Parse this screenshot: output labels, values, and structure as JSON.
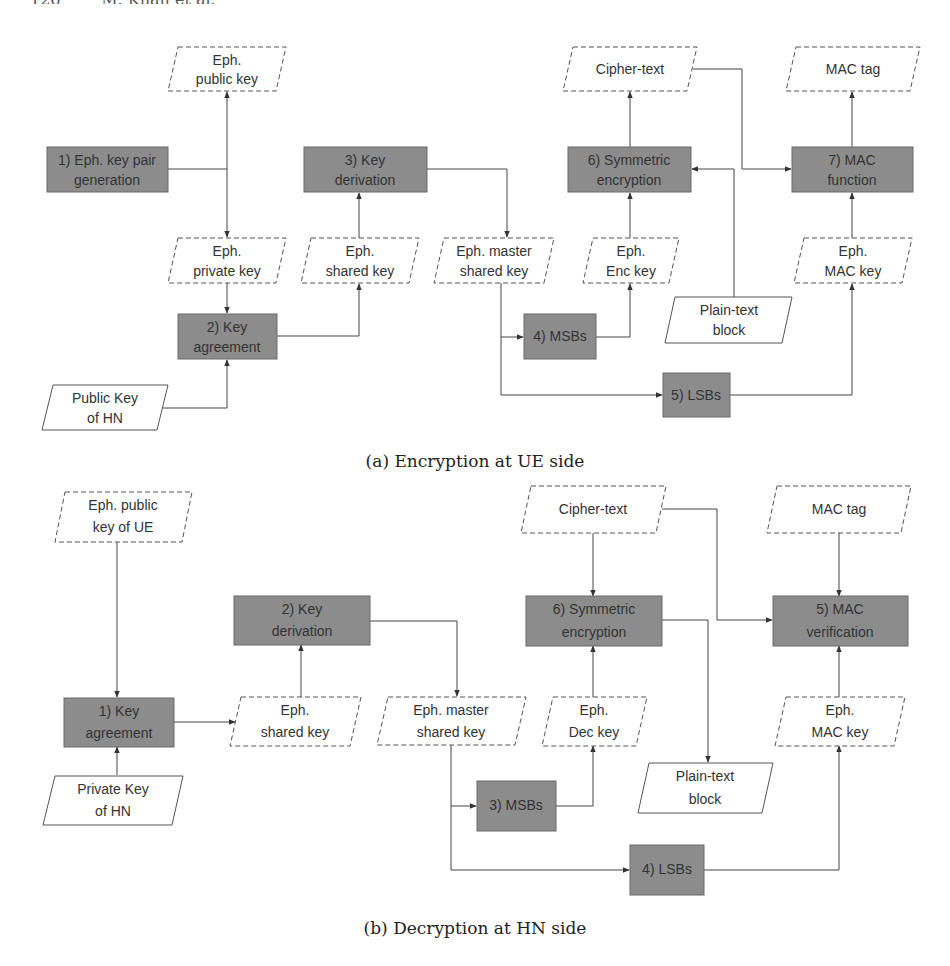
{
  "page_header": "126        M. Khan et al.",
  "colors": {
    "process_fill": "#8c8c8c",
    "process_stroke": "#6a6a6a",
    "data_stroke": "#555555",
    "edge": "#444444",
    "background": "#ffffff"
  },
  "figure_a": {
    "caption": "(a) Encryption at UE side",
    "nodes": {
      "eph_public_key": [
        "Eph.",
        "public key"
      ],
      "keypair_gen": [
        "1) Eph. key pair",
        "generation"
      ],
      "eph_private_key": [
        "Eph.",
        "private key"
      ],
      "key_agreement": [
        "2) Key",
        "agreement"
      ],
      "public_key_hn": [
        "Public Key",
        "of HN"
      ],
      "key_derivation": [
        "3) Key",
        "derivation"
      ],
      "eph_shared_key": [
        "Eph.",
        "shared key"
      ],
      "eph_master_shared_key": [
        "Eph. master",
        "shared key"
      ],
      "msbs": [
        "4) MSBs"
      ],
      "eph_enc_key": [
        "Eph.",
        "Enc key"
      ],
      "sym_encryption": [
        "6) Symmetric",
        "encryption"
      ],
      "cipher_text": [
        "Cipher-text"
      ],
      "plain_text_block": [
        "Plain-text",
        "block"
      ],
      "lsbs": [
        "5) LSBs"
      ],
      "eph_mac_key": [
        "Eph.",
        "MAC key"
      ],
      "mac_function": [
        "7) MAC",
        "function"
      ],
      "mac_tag": [
        "MAC tag"
      ]
    }
  },
  "figure_b": {
    "caption": "(b) Decryption at HN side",
    "nodes": {
      "eph_public_key_ue": [
        "Eph. public",
        "key of UE"
      ],
      "key_agreement": [
        "1) Key",
        "agreement"
      ],
      "private_key_hn": [
        "Private Key",
        "of HN"
      ],
      "key_derivation": [
        "2) Key",
        "derivation"
      ],
      "eph_shared_key": [
        "Eph.",
        "shared key"
      ],
      "eph_master_shared_key": [
        "Eph. master",
        "shared key"
      ],
      "msbs": [
        "3) MSBs"
      ],
      "eph_dec_key": [
        "Eph.",
        "Dec key"
      ],
      "sym_encryption": [
        "6) Symmetric",
        "encryption"
      ],
      "cipher_text": [
        "Cipher-text"
      ],
      "plain_text_block": [
        "Plain-text",
        "block"
      ],
      "lsbs": [
        "4) LSBs"
      ],
      "eph_mac_key": [
        "Eph.",
        "MAC key"
      ],
      "mac_verification": [
        "5) MAC",
        "verification"
      ],
      "mac_tag": [
        "MAC tag"
      ]
    }
  }
}
